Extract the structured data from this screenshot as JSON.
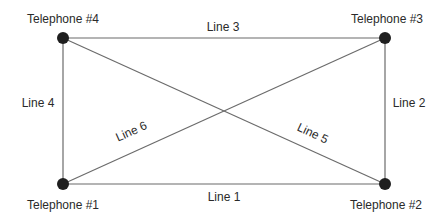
{
  "diagram": {
    "type": "network",
    "nodes": [
      {
        "id": "t1",
        "label": "Telephone #1",
        "x": 63,
        "y": 184,
        "label_x": 63,
        "label_y": 209
      },
      {
        "id": "t2",
        "label": "Telephone #2",
        "x": 385,
        "y": 184,
        "label_x": 386,
        "label_y": 209
      },
      {
        "id": "t3",
        "label": "Telephone #3",
        "x": 385,
        "y": 38,
        "label_x": 387,
        "label_y": 23
      },
      {
        "id": "t4",
        "label": "Telephone #4",
        "x": 63,
        "y": 38,
        "label_x": 63,
        "label_y": 23
      }
    ],
    "edges": [
      {
        "id": "line1",
        "label": "Line 1",
        "from": "t1",
        "to": "t2",
        "label_x": 224,
        "label_y": 201,
        "rotate": 0
      },
      {
        "id": "line2",
        "label": "Line 2",
        "from": "t2",
        "to": "t3",
        "label_x": 409,
        "label_y": 107,
        "rotate": 0
      },
      {
        "id": "line3",
        "label": "Line 3",
        "from": "t4",
        "to": "t3",
        "label_x": 223,
        "label_y": 31,
        "rotate": 0
      },
      {
        "id": "line4",
        "label": "Line 4",
        "from": "t1",
        "to": "t4",
        "label_x": 38,
        "label_y": 107,
        "rotate": 0
      },
      {
        "id": "line5",
        "label": "Line 5",
        "from": "t4",
        "to": "t2",
        "label_x": 311,
        "label_y": 137,
        "rotate": 25
      },
      {
        "id": "line6",
        "label": "Line 6",
        "from": "t1",
        "to": "t3",
        "label_x": 133,
        "label_y": 135,
        "rotate": -24
      }
    ]
  }
}
